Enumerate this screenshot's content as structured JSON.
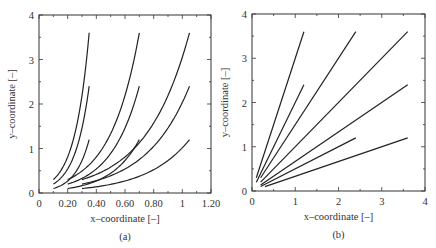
{
  "chart_data": [
    {
      "panel": "(a)",
      "type": "line",
      "title": "",
      "xlabel": "x–coordinate [–]",
      "ylabel": "y–coordinate [–]",
      "xlim": [
        0,
        1.2
      ],
      "ylim": [
        0,
        4
      ],
      "xticks": [
        "0",
        "0.20",
        "0.40",
        "0.60",
        "0.80",
        "1",
        "1.20"
      ],
      "yticks": [
        "0",
        "1",
        "2",
        "3",
        "4"
      ],
      "grid": false,
      "curve_shape": "exponential",
      "series": [
        {
          "name": "curve-1",
          "x": [
            0.1,
            0.35
          ],
          "y": [
            0.3,
            3.6
          ]
        },
        {
          "name": "curve-2",
          "x": [
            0.1,
            0.35
          ],
          "y": [
            0.2,
            2.4
          ]
        },
        {
          "name": "curve-3",
          "x": [
            0.1,
            0.35
          ],
          "y": [
            0.1,
            1.2
          ]
        },
        {
          "name": "curve-4",
          "x": [
            0.2,
            0.7
          ],
          "y": [
            0.3,
            3.6
          ]
        },
        {
          "name": "curve-5",
          "x": [
            0.2,
            0.7
          ],
          "y": [
            0.2,
            2.4
          ]
        },
        {
          "name": "curve-6",
          "x": [
            0.2,
            0.7
          ],
          "y": [
            0.1,
            1.2
          ]
        },
        {
          "name": "curve-7",
          "x": [
            0.3,
            1.05
          ],
          "y": [
            0.3,
            3.6
          ]
        },
        {
          "name": "curve-8",
          "x": [
            0.3,
            1.05
          ],
          "y": [
            0.2,
            2.4
          ]
        },
        {
          "name": "curve-9",
          "x": [
            0.3,
            1.05
          ],
          "y": [
            0.1,
            1.2
          ]
        }
      ],
      "caption": "(a)"
    },
    {
      "panel": "(b)",
      "type": "line",
      "title": "",
      "xlabel": "x–coordinate [–]",
      "ylabel": "y–coordinate [–]",
      "xlim": [
        0,
        4
      ],
      "ylim": [
        0,
        4
      ],
      "xticks": [
        "0",
        "1",
        "2",
        "3",
        "4"
      ],
      "yticks": [
        "0",
        "1",
        "2",
        "3",
        "4"
      ],
      "grid": false,
      "curve_shape": "linear",
      "series": [
        {
          "name": "line-1",
          "x": [
            0.1,
            1.2
          ],
          "y": [
            0.3,
            3.6
          ]
        },
        {
          "name": "line-2",
          "x": [
            0.1,
            1.2
          ],
          "y": [
            0.2,
            2.4
          ]
        },
        {
          "name": "line-3",
          "x": [
            0.2,
            2.4
          ],
          "y": [
            0.3,
            3.6
          ]
        },
        {
          "name": "line-4",
          "x": [
            0.2,
            3.6
          ],
          "y": [
            0.2,
            3.6
          ]
        },
        {
          "name": "line-5",
          "x": [
            0.2,
            3.6
          ],
          "y": [
            0.133,
            2.4
          ]
        },
        {
          "name": "line-6",
          "x": [
            0.2,
            2.4
          ],
          "y": [
            0.1,
            1.2
          ]
        },
        {
          "name": "line-7",
          "x": [
            0.3,
            3.6
          ],
          "y": [
            0.1,
            1.2
          ]
        }
      ],
      "caption": "(b)"
    }
  ]
}
